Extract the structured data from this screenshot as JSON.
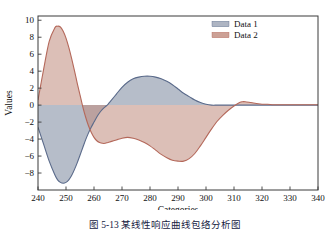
{
  "figure": {
    "caption": "图 5-13   某线性响应曲线包络分析图"
  },
  "chart_data": {
    "type": "area",
    "title": "",
    "xlabel": "Categories",
    "ylabel": "Values",
    "xlim": [
      240,
      340
    ],
    "ylim": [
      -10.0,
      10.5
    ],
    "xticks": [
      240,
      250,
      260,
      270,
      280,
      290,
      300,
      310,
      320,
      330,
      340
    ],
    "yticks": [
      10,
      8,
      6,
      4,
      2,
      0,
      -2,
      -4,
      -6,
      -8
    ],
    "grid": false,
    "legend_position": "top-right",
    "legend": [
      "Data 1",
      "Data 2"
    ],
    "colors": {
      "data1_line": "#5a6a8a",
      "data1_fill": "#9aa3b4",
      "data2_line": "#b4685a",
      "data2_fill": "#bf8a7c",
      "axis": "#3a3a3a",
      "text": "#111111"
    },
    "x": [
      240,
      242,
      244,
      246,
      247,
      248,
      249,
      250,
      251,
      252,
      253,
      254,
      255,
      256,
      257,
      258,
      259,
      260,
      261,
      262,
      263,
      264,
      265,
      266,
      268,
      270,
      272,
      274,
      276,
      278,
      280,
      282,
      284,
      286,
      288,
      290,
      292,
      294,
      296,
      298,
      300,
      302,
      304,
      306,
      308,
      310,
      312,
      313,
      314,
      316,
      318,
      320,
      322,
      324,
      326,
      328,
      330,
      332,
      334,
      336,
      338,
      340
    ],
    "series": [
      {
        "name": "Data 1",
        "values": [
          -2.6,
          -4.6,
          -6.6,
          -8.2,
          -8.8,
          -9.1,
          -9.2,
          -9.1,
          -8.8,
          -8.3,
          -7.6,
          -6.8,
          -5.9,
          -5.0,
          -4.1,
          -3.3,
          -2.6,
          -2.0,
          -1.4,
          -0.9,
          -0.5,
          -0.2,
          0.1,
          0.5,
          1.3,
          2.1,
          2.7,
          3.1,
          3.3,
          3.4,
          3.4,
          3.3,
          3.1,
          2.8,
          2.4,
          1.9,
          1.4,
          1.0,
          0.6,
          0.3,
          0.1,
          0.0,
          0.0,
          0.0,
          0.0,
          0.0,
          0.0,
          0.0,
          0.0,
          0.0,
          0.0,
          0.0,
          0.0,
          0.0,
          0.0,
          0.0,
          0.0,
          0.0,
          0.0,
          0.0,
          0.0,
          0.0
        ]
      },
      {
        "name": "Data 2",
        "values": [
          0.6,
          4.2,
          7.5,
          9.1,
          9.3,
          9.2,
          8.7,
          7.9,
          6.8,
          5.5,
          4.1,
          2.6,
          1.2,
          -0.2,
          -1.4,
          -2.4,
          -3.2,
          -3.8,
          -4.2,
          -4.4,
          -4.5,
          -4.5,
          -4.4,
          -4.3,
          -4.1,
          -3.9,
          -3.8,
          -3.9,
          -4.1,
          -4.4,
          -4.8,
          -5.3,
          -5.8,
          -6.2,
          -6.5,
          -6.6,
          -6.6,
          -6.3,
          -5.7,
          -4.8,
          -3.8,
          -2.8,
          -1.9,
          -1.2,
          -0.6,
          -0.1,
          0.3,
          0.4,
          0.4,
          0.3,
          0.2,
          0.1,
          0.1,
          0.05,
          0.05,
          0.05,
          0.05,
          0.05,
          0.05,
          0.05,
          0.05,
          0.05
        ]
      }
    ]
  }
}
